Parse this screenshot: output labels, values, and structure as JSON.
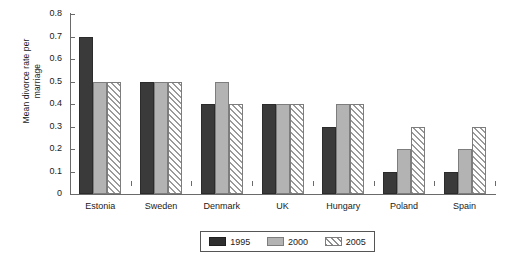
{
  "chart_data": {
    "type": "bar",
    "title": "",
    "xlabel": "",
    "ylabel": "Mean divorce rate per\nmarriage",
    "ylim": [
      0,
      0.8
    ],
    "ytick_labels": [
      "0",
      "0.1",
      "0.2",
      "0.3",
      "0.4",
      "0.5",
      "0.6",
      "0.7",
      "0.8"
    ],
    "ytick_values": [
      0,
      0.1,
      0.2,
      0.3,
      0.4,
      0.5,
      0.6,
      0.7,
      0.8
    ],
    "grid": false,
    "legend_position": "bottom-center",
    "categories": [
      "Estonia",
      "Sweden",
      "Denmark",
      "UK",
      "Hungary",
      "Poland",
      "Spain"
    ],
    "series": [
      {
        "name": "1995",
        "color": "#3a3a3a",
        "fill": "solid-dark",
        "values": [
          0.7,
          0.5,
          0.4,
          0.4,
          0.3,
          0.1,
          0.1
        ]
      },
      {
        "name": "2000",
        "color": "#b3b3b3",
        "fill": "solid-gray",
        "values": [
          0.5,
          0.5,
          0.5,
          0.4,
          0.4,
          0.2,
          0.2
        ]
      },
      {
        "name": "2005",
        "color": "#ffffff",
        "fill": "diagonal-hatch",
        "values": [
          0.5,
          0.5,
          0.4,
          0.4,
          0.4,
          0.3,
          0.3
        ]
      }
    ]
  },
  "legend": {
    "items": [
      {
        "label": "1995"
      },
      {
        "label": "2000"
      },
      {
        "label": "2005"
      }
    ]
  }
}
